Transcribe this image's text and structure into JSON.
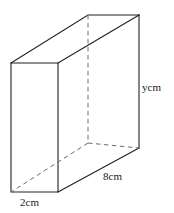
{
  "figure": {
    "type": "cuboid-diagram",
    "stroke_color": "#231f20",
    "dashed_color": "#6b6b6b",
    "background_color": "#ffffff",
    "labels": {
      "width": "2cm",
      "length": "8cm",
      "height": "ycm"
    },
    "geometry": {
      "front_top_left": [
        11,
        63
      ],
      "front_top_right": [
        58,
        63
      ],
      "front_bottom_right": [
        58,
        192
      ],
      "front_bottom_left": [
        11,
        192
      ],
      "back_top_left": [
        88,
        15
      ],
      "back_top_right": [
        139,
        15
      ],
      "back_bottom_right": [
        139,
        148
      ],
      "back_bottom_left": [
        88,
        143
      ]
    }
  }
}
